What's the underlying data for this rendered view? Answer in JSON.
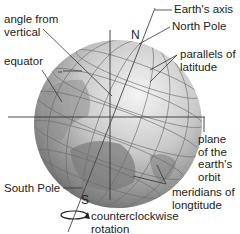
{
  "diagram": {
    "labels": {
      "angle_from_vertical": [
        "angle from",
        "vertical"
      ],
      "equator": "equator",
      "earths_axis": "Earth's axis",
      "north_pole": "North Pole",
      "parallels_of_latitude": [
        "parallels of",
        "latitude"
      ],
      "plane_of_orbit": [
        "plane",
        "of the",
        "earth's",
        "orbit"
      ],
      "south_pole": "South Pole",
      "meridians_of_longitude": [
        "meridians of",
        "longtitude"
      ],
      "counterclockwise_rotation": [
        "counterclockwise",
        "rotation"
      ],
      "pole_n": "N",
      "pole_s": "S"
    },
    "colors": {
      "globe_light": "#e8e8e8",
      "globe_mid": "#a9a9a9",
      "globe_dark": "#5a5a5a",
      "land": "#8c8c8c",
      "lines": "#333333",
      "text": "#222222"
    }
  }
}
